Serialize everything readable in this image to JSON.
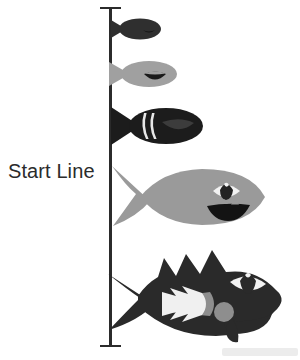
{
  "diagram": {
    "title": "Start Line",
    "background_color": "#ffffff",
    "start_line": {
      "label": "Start Line",
      "line_color": "#2b2b2b",
      "orientation": "vertical",
      "has_end_caps": true
    },
    "fish": [
      {
        "id": "fish-1",
        "order_label": "1",
        "size_label": "smallest",
        "body_color": "#2f2f2f",
        "features": "plain dark body, tail fin, small mouth notch",
        "has_eye": false,
        "has_teeth": false
      },
      {
        "id": "fish-2",
        "order_label": "2",
        "size_label": "small",
        "body_color": "#a0a0a0",
        "features": "gray body with dark curved mouth",
        "has_eye": false,
        "has_teeth": false
      },
      {
        "id": "fish-3",
        "order_label": "3",
        "size_label": "medium",
        "body_color": "#1c1c1c",
        "features": "black body with two light gill stripes and dark mouth",
        "has_eye": false,
        "has_teeth": false
      },
      {
        "id": "fish-4",
        "order_label": "4",
        "size_label": "large",
        "body_color": "#9a9a9a",
        "features": "gray body, almond eye with white sclera, wide toothy grin",
        "has_eye": true,
        "has_teeth": true
      },
      {
        "id": "fish-5",
        "order_label": "5",
        "size_label": "largest",
        "body_color": "#2a2a2a",
        "features": "dark body with spiked dorsal fins, white zigzag teeth, eye, gray gill circle and barbel",
        "has_eye": true,
        "has_teeth": true
      }
    ],
    "colors": {
      "line": "#2b2b2b",
      "label_text": "#2b2b2b",
      "light_gray": "#9a9a9a",
      "mid_gray": "#a0a0a0",
      "dark": "#2a2a2a",
      "black": "#1c1c1c",
      "white": "#ffffff"
    }
  }
}
